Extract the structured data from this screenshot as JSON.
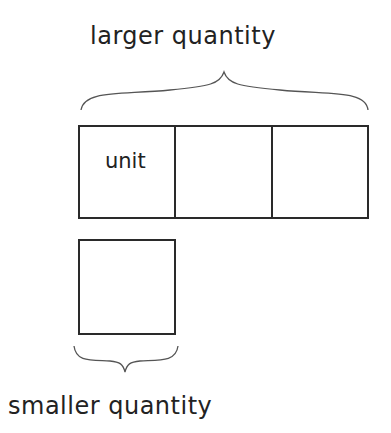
{
  "diagram": {
    "top_label": "larger quantity",
    "bottom_label": "smaller quantity",
    "bar": {
      "cells": [
        {
          "label": "unit"
        },
        {
          "label": ""
        },
        {
          "label": ""
        }
      ]
    },
    "small_box": {
      "label": ""
    },
    "colors": {
      "stroke": "#2a2a2a",
      "text": "#222222",
      "background": "#ffffff"
    }
  }
}
